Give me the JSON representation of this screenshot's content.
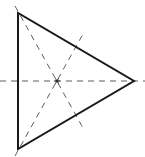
{
  "diagram": {
    "type": "equilateral-triangle-symmetry-axes",
    "triangle": {
      "vertices": [
        [
          18,
          13
        ],
        [
          18,
          149
        ],
        [
          134,
          81
        ]
      ],
      "stroke": "#1a1a1a",
      "stroke_width": 2
    },
    "axes": [
      {
        "name": "horizontal-axis",
        "from": [
          0,
          81
        ],
        "to": [
          145,
          81
        ]
      },
      {
        "name": "axis-top-vertex",
        "from": [
          15,
          6
        ],
        "to": [
          83,
          128
        ]
      },
      {
        "name": "axis-bottom-vertex",
        "from": [
          15,
          156
        ],
        "to": [
          83,
          34
        ]
      }
    ],
    "axis_style": {
      "stroke": "#333333",
      "dash": "6,5",
      "stroke_width": 0.8
    },
    "center": {
      "x": 57,
      "y": 81,
      "marker": "asterisk"
    }
  }
}
